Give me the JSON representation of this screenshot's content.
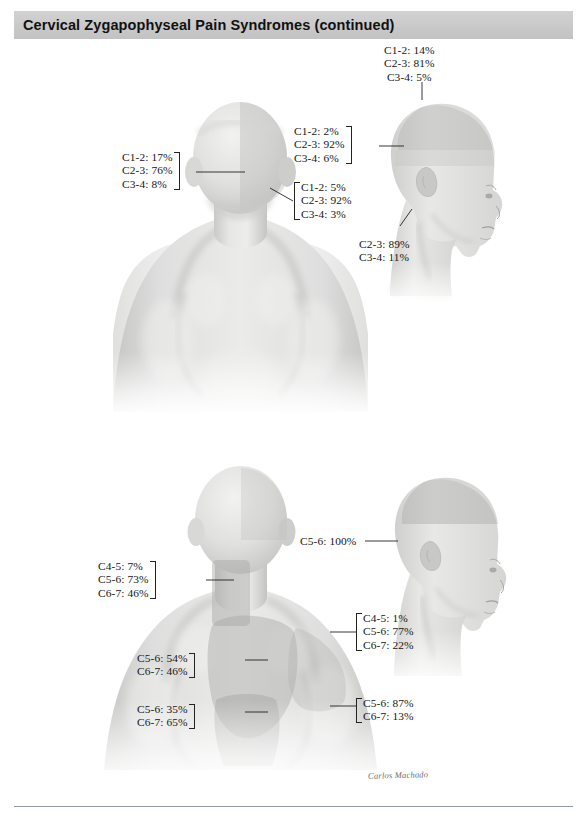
{
  "page": {
    "title": "Cervical Zygapophyseal Pain Syndromes (continued)",
    "signature": "Carlos Machado"
  },
  "figures": [
    {
      "id": "upper-figure",
      "name": "posterior-head-and-upper-back",
      "description": "Posterior view of head, neck and upper back with pain referral zones",
      "labels": [
        {
          "name": "label-top-vertex",
          "lines": [
            "C1-2: 14%",
            "C2-3: 81%",
            "C3-4: 5%"
          ],
          "bracket": "none"
        },
        {
          "name": "label-occipital-left",
          "lines": [
            "C1-2: 17%",
            "C2-3: 76%",
            "C3-4: 8%"
          ],
          "bracket": "right"
        },
        {
          "name": "label-upper-occiput",
          "lines": [
            "C1-2: 2%",
            "C2-3: 92%",
            "C3-4: 6%"
          ],
          "bracket": "right"
        },
        {
          "name": "label-suboccipital",
          "lines": [
            "C1-2: 5%",
            "C2-3: 92%",
            "C3-4: 3%"
          ],
          "bracket": "left"
        },
        {
          "name": "label-lateral-neck",
          "lines": [
            "C2-3: 89%",
            "C3-4: 11%"
          ],
          "bracket": "none"
        }
      ]
    },
    {
      "id": "lower-figure",
      "name": "posterior-neck-and-shoulders",
      "description": "Posterior view of neck, shoulders and upper thorax with pain referral zones",
      "labels": [
        {
          "name": "label-lateral-head",
          "lines": [
            "C5-6: 100%"
          ],
          "bracket": "none"
        },
        {
          "name": "label-posterior-neck",
          "lines": [
            "C4-5: 7%",
            "C5-6: 73%",
            "C6-7: 46%"
          ],
          "bracket": "right"
        },
        {
          "name": "label-supraspinous",
          "lines": [
            "C4-5: 1%",
            "C5-6: 77%",
            "C6-7: 22%"
          ],
          "bracket": "left"
        },
        {
          "name": "label-upper-scapular",
          "lines": [
            "C5-6: 54%",
            "C6-7: 46%"
          ],
          "bracket": "right"
        },
        {
          "name": "label-lower-scapular",
          "lines": [
            "C5-6: 35%",
            "C6-7: 65%"
          ],
          "bracket": "right"
        },
        {
          "name": "label-shoulder",
          "lines": [
            "C5-6: 87%",
            "C6-7: 13%"
          ],
          "bracket": "left"
        }
      ]
    }
  ]
}
